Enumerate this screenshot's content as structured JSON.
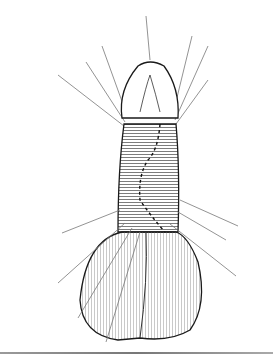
{
  "figure": {
    "kind": "surgical line illustration",
    "colors": {
      "ink": "#1a1a1a",
      "shading": "#c8c8c8",
      "background": "#ffffff",
      "rule": "#888888"
    }
  }
}
